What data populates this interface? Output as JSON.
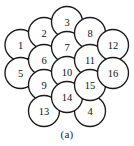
{
  "figure": {
    "caption": "(a)",
    "background_color": "#ffffff",
    "stroke_color": "#1a1a1a",
    "fill_color": "#ffffff",
    "label_color": "#111111",
    "circle_radius": 15.5,
    "circles": [
      {
        "label": "1",
        "cx": 20.5,
        "cy": 45,
        "r": 15.5
      },
      {
        "label": "2",
        "cx": 44,
        "cy": 33,
        "r": 15.5
      },
      {
        "label": "3",
        "cx": 67,
        "cy": 22,
        "r": 15.5
      },
      {
        "label": "4",
        "cx": 90,
        "cy": 111,
        "r": 15.5
      },
      {
        "label": "5",
        "cx": 20.5,
        "cy": 73,
        "r": 15.5
      },
      {
        "label": "6",
        "cx": 44,
        "cy": 60,
        "r": 15.5
      },
      {
        "label": "7",
        "cx": 67,
        "cy": 47,
        "r": 15.5
      },
      {
        "label": "8",
        "cx": 90,
        "cy": 33,
        "r": 15.5
      },
      {
        "label": "9",
        "cx": 44,
        "cy": 85,
        "r": 15.5
      },
      {
        "label": "10",
        "cx": 67,
        "cy": 72,
        "r": 15.5
      },
      {
        "label": "11",
        "cx": 90,
        "cy": 60,
        "r": 15.5
      },
      {
        "label": "12",
        "cx": 113,
        "cy": 45,
        "r": 15.5
      },
      {
        "label": "13",
        "cx": 44,
        "cy": 111,
        "r": 15.5
      },
      {
        "label": "14",
        "cx": 67,
        "cy": 97,
        "r": 15.5
      },
      {
        "label": "15",
        "cx": 90,
        "cy": 85,
        "r": 15.5
      },
      {
        "label": "16",
        "cx": 113,
        "cy": 73,
        "r": 15.5
      }
    ]
  },
  "chart_data": {
    "type": "scatter",
    "title": "(a)",
    "xlabel": "",
    "ylabel": "",
    "xlim": [
      0,
      134
    ],
    "ylim": [
      0,
      128
    ],
    "grid": false,
    "legend": "none",
    "annotations": [
      "(a)"
    ],
    "categories": [
      "1",
      "2",
      "3",
      "4",
      "5",
      "6",
      "7",
      "8",
      "9",
      "10",
      "11",
      "12",
      "13",
      "14",
      "15",
      "16"
    ],
    "series": [
      {
        "name": "circle centers",
        "marker": "circle-outline",
        "marker_radius": 15.5,
        "x": [
          20.5,
          44,
          67,
          90,
          20.5,
          44,
          67,
          90,
          44,
          67,
          90,
          113,
          44,
          67,
          90,
          113
        ],
        "y": [
          45,
          33,
          22,
          111,
          73,
          60,
          47,
          33,
          85,
          72,
          60,
          45,
          111,
          97,
          85,
          73
        ],
        "values": [
          1,
          2,
          3,
          4,
          5,
          6,
          7,
          8,
          9,
          10,
          11,
          12,
          13,
          14,
          15,
          16
        ]
      }
    ]
  }
}
